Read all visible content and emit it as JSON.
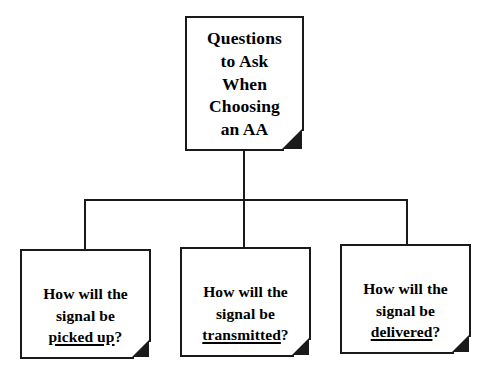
{
  "diagram": {
    "title": "Questions to Ask When Choosing an AA",
    "type": "organizational-tree",
    "orientation": "top-down",
    "colors": {
      "background": "#ffffff",
      "line": "#1a1a1a",
      "box_border": "#1a1a1a",
      "box_fill": "#ffffff",
      "text": "#000000",
      "fold_corner": "#1a1a1a"
    },
    "root": {
      "id": "root",
      "shape": "note-with-folded-corner",
      "lines": [
        "Questions",
        "to Ask",
        "When",
        "Choosing",
        "an AA"
      ]
    },
    "children": [
      {
        "id": "picked-up",
        "shape": "note-with-folded-corner",
        "lines": [
          {
            "text": "How will the",
            "underline": false
          },
          {
            "text": "signal be",
            "underline": false
          },
          {
            "text": "picked up",
            "underline": true,
            "suffix": "?"
          }
        ]
      },
      {
        "id": "transmitted",
        "shape": "note-with-folded-corner",
        "lines": [
          {
            "text": "How will the",
            "underline": false
          },
          {
            "text": "signal be",
            "underline": false
          },
          {
            "text": "transmitted",
            "underline": true,
            "suffix": "?"
          }
        ]
      },
      {
        "id": "delivered",
        "shape": "note-with-folded-corner",
        "lines": [
          {
            "text": "How will the",
            "underline": false
          },
          {
            "text": "signal be",
            "underline": false
          },
          {
            "text": "delivered",
            "underline": true,
            "suffix": "?"
          }
        ]
      }
    ]
  }
}
